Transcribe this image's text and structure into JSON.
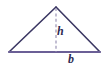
{
  "figure": {
    "type": "geometry-diagram",
    "shape": "triangle",
    "background_color": "#ffffff",
    "labels": {
      "height": "h",
      "base": "b"
    },
    "colors": {
      "outline": "#3b3763",
      "base_line": "#6b5f96",
      "dashed_height_line": "#9a93b5",
      "label_text": "#2e2a52"
    },
    "geometry": {
      "apex": [
        56,
        7
      ],
      "left_vertex": [
        9,
        52
      ],
      "right_vertex": [
        100,
        52
      ],
      "height_foot": [
        56,
        52
      ],
      "base_length_px": 91,
      "height_length_px": 45
    },
    "strokes": {
      "outline_width": 1.6,
      "base_width": 1.8,
      "dash_width": 1.2,
      "dash_pattern": "3,2.4"
    }
  }
}
